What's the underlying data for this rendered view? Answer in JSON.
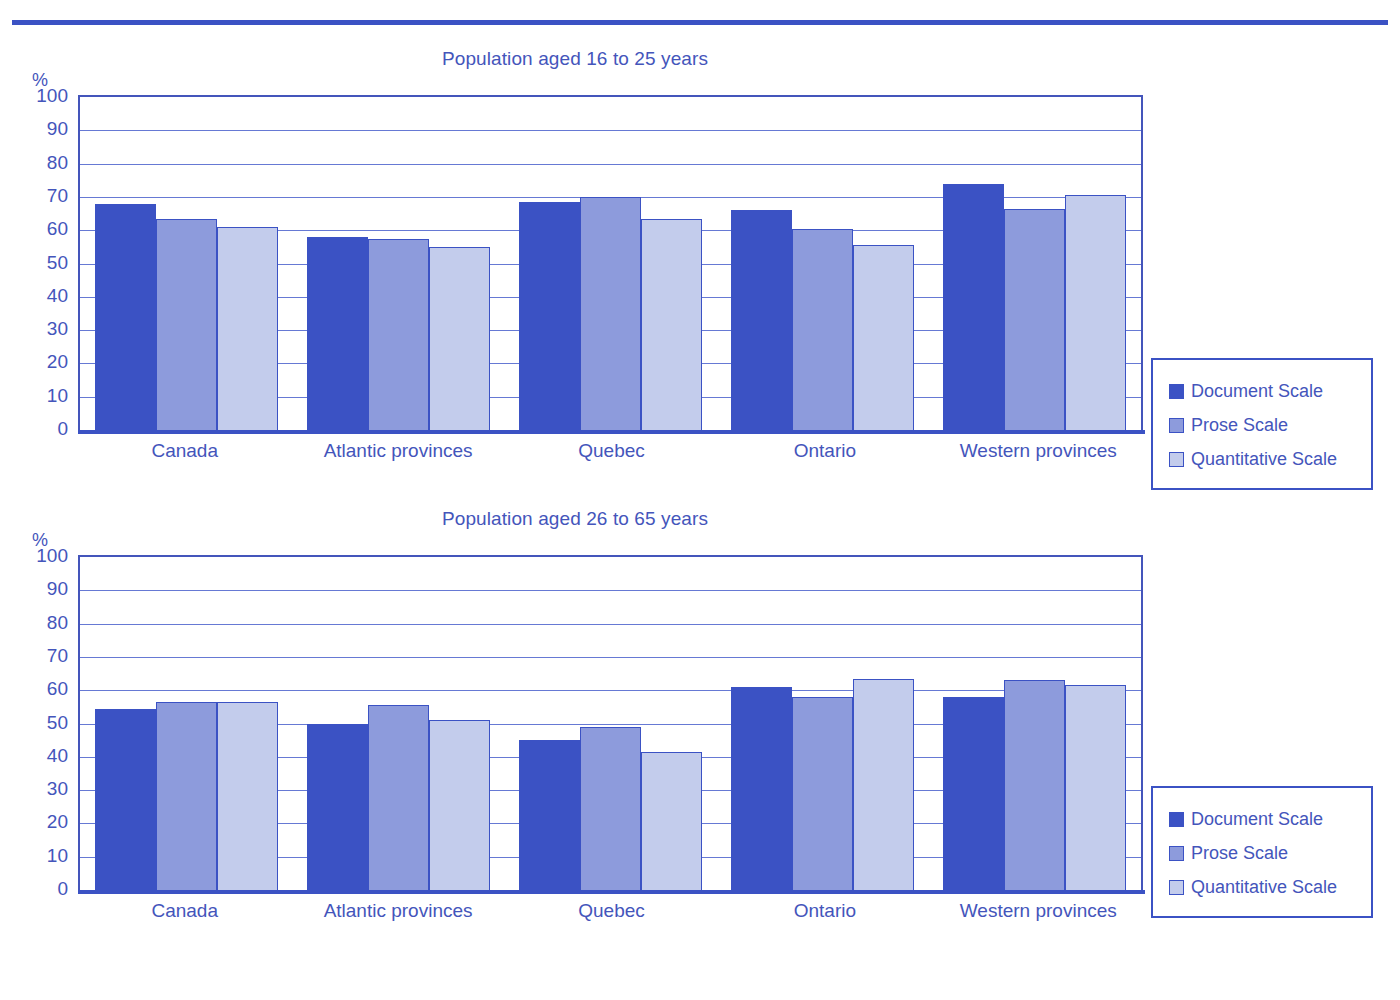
{
  "page": {
    "rule_color": "#3B52C4",
    "background": "#ffffff"
  },
  "series_colors": {
    "document_scale": "#3B52C4",
    "prose_scale": "#8D9BDC",
    "quantitative_scale": "#C3CCEC"
  },
  "axis": {
    "unit_label": "%",
    "ticks": [
      "100",
      "90",
      "80",
      "70",
      "60",
      "50",
      "40",
      "30",
      "20",
      "10",
      "0"
    ]
  },
  "legend": {
    "items": [
      {
        "label": "Document Scale",
        "color": "#3B52C4"
      },
      {
        "label": "Prose Scale",
        "color": "#8D9BDC"
      },
      {
        "label": "Quantitative Scale",
        "color": "#C3CCEC"
      }
    ]
  },
  "chart_data": [
    {
      "type": "bar",
      "title": "Population aged 16 to 25 years",
      "xlabel": "",
      "ylabel": "%",
      "ylim": [
        0,
        100
      ],
      "ytick_step": 10,
      "grid": true,
      "legend_position": "right",
      "categories": [
        "Canada",
        "Atlantic provinces",
        "Quebec",
        "Ontario",
        "Western provinces"
      ],
      "series": [
        {
          "name": "Document Scale",
          "values": [
            68.0,
            58.0,
            68.5,
            66.0,
            74.0
          ]
        },
        {
          "name": "Prose Scale",
          "values": [
            63.5,
            57.5,
            70.0,
            60.5,
            66.5
          ]
        },
        {
          "name": "Quantitative Scale",
          "values": [
            61.0,
            55.0,
            63.5,
            55.5,
            70.5
          ]
        }
      ]
    },
    {
      "type": "bar",
      "title": "Population aged 26 to 65 years",
      "xlabel": "",
      "ylabel": "%",
      "ylim": [
        0,
        100
      ],
      "ytick_step": 10,
      "grid": true,
      "legend_position": "right",
      "categories": [
        "Canada",
        "Atlantic provinces",
        "Quebec",
        "Ontario",
        "Western provinces"
      ],
      "series": [
        {
          "name": "Document Scale",
          "values": [
            54.5,
            50.0,
            45.0,
            61.0,
            58.0
          ]
        },
        {
          "name": "Prose Scale",
          "values": [
            56.5,
            55.5,
            49.0,
            58.0,
            63.0
          ]
        },
        {
          "name": "Quantitative Scale",
          "values": [
            56.5,
            51.0,
            41.5,
            63.5,
            61.5
          ]
        }
      ]
    }
  ]
}
